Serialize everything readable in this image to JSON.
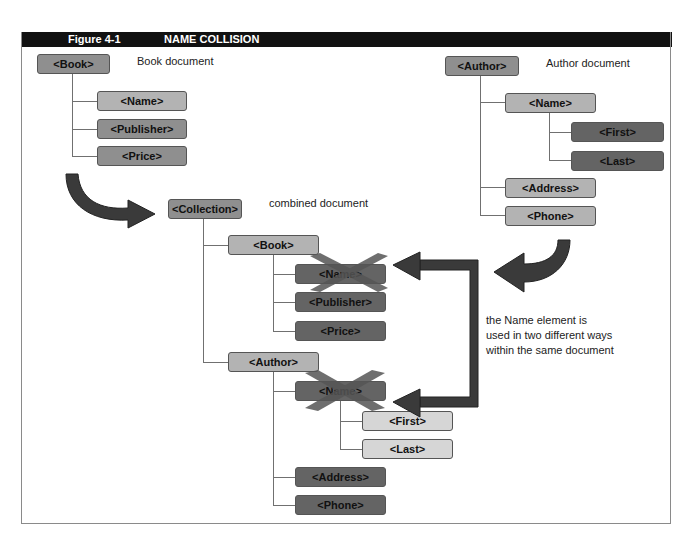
{
  "header": {
    "figure_label": "Figure 4-1",
    "title": "NAME COLLISION"
  },
  "book_document": {
    "caption": "Book document",
    "root": "<Book>",
    "children": [
      "<Name>",
      "<Publisher>",
      "<Price>"
    ]
  },
  "author_document": {
    "caption": "Author document",
    "root": "<Author>",
    "name": "<Name>",
    "name_children": [
      "<First>",
      "<Last>"
    ],
    "children_after_name": [
      "<Address>",
      "<Phone>"
    ]
  },
  "combined_document": {
    "caption": "combined document",
    "root": "<Collection>",
    "book": {
      "label": "<Book>",
      "children": [
        "<Name>",
        "<Publisher>",
        "<Price>"
      ]
    },
    "author": {
      "label": "<Author>",
      "name": "<Name>",
      "name_children": [
        "<First>",
        "<Last>"
      ],
      "children_after_name": [
        "<Address>",
        "<Phone>"
      ]
    }
  },
  "annotation": {
    "lines": [
      "the Name element is",
      "used in two different ways",
      "within the same document"
    ]
  },
  "colors": {
    "header_bg": "#111111",
    "box_mid": "#8f8f8f",
    "box_light": "#b3b3b3",
    "box_lighter": "#d6d6d6",
    "box_dark": "#646464",
    "arrow": "#3a3a3a",
    "cross": "#555555"
  }
}
